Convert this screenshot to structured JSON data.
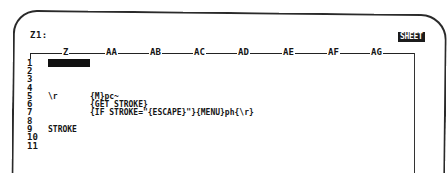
{
  "control_panel": {
    "cell_address": "Z1:",
    "mode_indicator": "SHEET"
  },
  "columns": [
    {
      "label": "Z",
      "x": 64
    },
    {
      "label": "AA",
      "x": 109
    },
    {
      "label": "AB",
      "x": 153
    },
    {
      "label": "AC",
      "x": 197
    },
    {
      "label": "AD",
      "x": 241
    },
    {
      "label": "AE",
      "x": 286
    },
    {
      "label": "AF",
      "x": 331
    },
    {
      "label": "AG",
      "x": 374
    }
  ],
  "rows": [
    {
      "num": "1",
      "y": 59
    },
    {
      "num": "2",
      "y": 67
    },
    {
      "num": "3",
      "y": 75
    },
    {
      "num": "4",
      "y": 84
    },
    {
      "num": "5",
      "y": 92
    },
    {
      "num": "6",
      "y": 100
    },
    {
      "num": "7",
      "y": 108
    },
    {
      "num": "8",
      "y": 117
    },
    {
      "num": "9",
      "y": 125
    },
    {
      "num": "10",
      "y": 133
    },
    {
      "num": "11",
      "y": 142
    }
  ],
  "cells": {
    "Z5": "\\r",
    "AA5": "{M}pc~",
    "AA6": "{GET STROKE}",
    "AA7": "{IF STROKE=\"{ESCAPE}\"}{MENU}ph{\\r}",
    "Z9": "STROKE"
  },
  "cursor_cell": "Z1"
}
